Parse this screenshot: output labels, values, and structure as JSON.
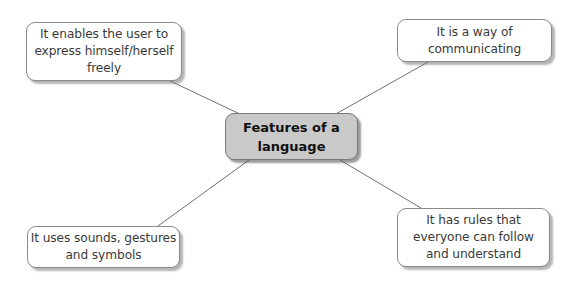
{
  "diagram": {
    "type": "mind-map",
    "center": {
      "lines": [
        "Features of a",
        "language"
      ],
      "fill": "#c9c9c9"
    },
    "branches": [
      {
        "position": "top-left",
        "lines": [
          "It enables the user to",
          "express himself/herself",
          "freely"
        ]
      },
      {
        "position": "top-right",
        "lines": [
          "It is a way of",
          "communicating"
        ]
      },
      {
        "position": "bottom-left",
        "lines": [
          "It uses sounds, gestures",
          "and symbols"
        ]
      },
      {
        "position": "bottom-right",
        "lines": [
          "It has rules that",
          "everyone can follow",
          "and understand"
        ]
      }
    ],
    "connector_color": "#6f6f6f"
  }
}
